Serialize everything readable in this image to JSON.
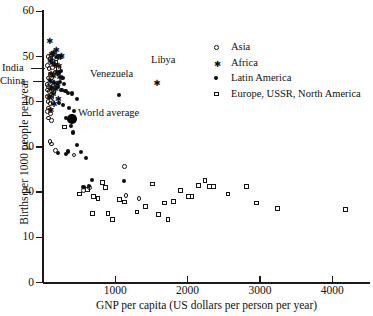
{
  "chart_data": {
    "type": "scatter",
    "title": "",
    "xlabel": "GNP per capita (US dollars per person per year)",
    "ylabel": "Births per 1000 people per year",
    "xlim": [
      0,
      4520
    ],
    "ylim": [
      0,
      62
    ],
    "xticks": [
      1000,
      2000,
      3000,
      4000
    ],
    "yticks": [
      0,
      10,
      20,
      30,
      40,
      50,
      60
    ],
    "grid": false,
    "legend_position": "top-right",
    "legend": [
      {
        "label": "Asia",
        "marker": "open-circle"
      },
      {
        "label": "Africa",
        "marker": "asterisk"
      },
      {
        "label": "Latin America",
        "marker": "filled-circle"
      },
      {
        "label": "Europe, USSR, North America",
        "marker": "open-square"
      }
    ],
    "annotations": [
      {
        "text": "India",
        "x": 160,
        "y": 44.0
      },
      {
        "text": "China",
        "x": 140,
        "y": 42.0
      },
      {
        "text": "Venezuela",
        "x": 1050,
        "y": 41.8
      },
      {
        "text": "Libya",
        "x": 1570,
        "y": 45.8
      },
      {
        "text": "World average",
        "x": 400,
        "y": 36.2
      }
    ],
    "series": [
      {
        "name": "Asia",
        "marker": "open-circle",
        "points": [
          [
            70,
            50.0
          ],
          [
            95,
            49.6
          ],
          [
            110,
            50.2
          ],
          [
            150,
            49.8
          ],
          [
            175,
            50.2
          ],
          [
            195,
            49.9
          ],
          [
            215,
            50.1
          ],
          [
            60,
            48.0
          ],
          [
            85,
            47.4
          ],
          [
            130,
            47.6
          ],
          [
            105,
            46.0
          ],
          [
            165,
            46.6
          ],
          [
            70,
            45.2
          ],
          [
            95,
            44.8
          ],
          [
            120,
            44.6
          ],
          [
            55,
            43.8
          ],
          [
            80,
            43.4
          ],
          [
            105,
            43.2
          ],
          [
            140,
            43.6
          ],
          [
            60,
            42.6
          ],
          [
            90,
            42.2
          ],
          [
            115,
            42.4
          ],
          [
            150,
            42.0
          ],
          [
            65,
            41.2
          ],
          [
            100,
            41.0
          ],
          [
            125,
            40.8
          ],
          [
            70,
            40.0
          ],
          [
            95,
            39.6
          ],
          [
            140,
            39.8
          ],
          [
            80,
            38.6
          ],
          [
            60,
            37.8
          ],
          [
            105,
            37.4
          ],
          [
            75,
            36.4
          ],
          [
            115,
            35.8
          ],
          [
            95,
            31.2
          ],
          [
            120,
            30.6
          ],
          [
            175,
            29.2
          ],
          [
            430,
            28.2
          ],
          [
            560,
            20.4
          ],
          [
            640,
            21.0
          ],
          [
            1130,
            25.6
          ],
          [
            1330,
            18.6
          ],
          [
            1150,
            19.2
          ]
        ]
      },
      {
        "name": "Africa",
        "marker": "asterisk",
        "points": [
          [
            85,
            53.4
          ],
          [
            175,
            51.4
          ],
          [
            115,
            50.6
          ],
          [
            140,
            50.8
          ],
          [
            200,
            50.0
          ],
          [
            230,
            49.8
          ],
          [
            250,
            50.2
          ],
          [
            95,
            49.0
          ],
          [
            125,
            48.6
          ],
          [
            160,
            48.2
          ],
          [
            210,
            47.8
          ],
          [
            185,
            46.4
          ],
          [
            105,
            46.2
          ],
          [
            135,
            45.6
          ],
          [
            225,
            45.4
          ],
          [
            90,
            44.6
          ],
          [
            150,
            44.2
          ],
          [
            195,
            44.0
          ],
          [
            110,
            43.0
          ],
          [
            165,
            42.8
          ],
          [
            130,
            41.8
          ],
          [
            80,
            41.0
          ],
          [
            205,
            40.6
          ],
          [
            145,
            39.4
          ],
          [
            100,
            38.2
          ],
          [
            1570,
            44.2
          ]
        ]
      },
      {
        "name": "Latin America",
        "marker": "filled-circle",
        "points": [
          [
            215,
            46.4
          ],
          [
            250,
            46.8
          ],
          [
            270,
            45.2
          ],
          [
            235,
            44.4
          ],
          [
            290,
            44.0
          ],
          [
            200,
            43.2
          ],
          [
            255,
            42.6
          ],
          [
            310,
            42.4
          ],
          [
            345,
            42.0
          ],
          [
            400,
            41.8
          ],
          [
            1050,
            41.4
          ],
          [
            470,
            40.6
          ],
          [
            225,
            39.8
          ],
          [
            280,
            39.2
          ],
          [
            360,
            38.6
          ],
          [
            430,
            38.0
          ],
          [
            320,
            36.4
          ],
          [
            390,
            34.6
          ],
          [
            420,
            33.2
          ],
          [
            465,
            30.4
          ],
          [
            350,
            29.0
          ],
          [
            530,
            28.8
          ],
          [
            210,
            28.6
          ],
          [
            320,
            28.4
          ],
          [
            600,
            27.6
          ],
          [
            680,
            22.6
          ],
          [
            560,
            21.2
          ],
          [
            1120,
            22.4
          ],
          [
            640,
            21.4
          ]
        ]
      },
      {
        "name": "Europe, USSR, North America",
        "marker": "open-square",
        "points": [
          [
            180,
            48.8
          ],
          [
            215,
            47.4
          ],
          [
            300,
            34.4
          ],
          [
            510,
            19.6
          ],
          [
            620,
            20.6
          ],
          [
            700,
            19.0
          ],
          [
            760,
            18.6
          ],
          [
            820,
            22.2
          ],
          [
            860,
            21.0
          ],
          [
            690,
            15.2
          ],
          [
            900,
            15.2
          ],
          [
            960,
            14.0
          ],
          [
            1060,
            18.4
          ],
          [
            1130,
            17.8
          ],
          [
            1300,
            15.6
          ],
          [
            1420,
            16.8
          ],
          [
            1520,
            21.8
          ],
          [
            1600,
            15.0
          ],
          [
            1680,
            17.6
          ],
          [
            1730,
            14.0
          ],
          [
            1800,
            18.0
          ],
          [
            1900,
            20.4
          ],
          [
            2010,
            19.0
          ],
          [
            2060,
            19.0
          ],
          [
            2150,
            21.4
          ],
          [
            2240,
            22.6
          ],
          [
            2300,
            21.2
          ],
          [
            2360,
            21.2
          ],
          [
            2560,
            19.6
          ],
          [
            2820,
            21.2
          ],
          [
            2950,
            17.6
          ],
          [
            3240,
            16.4
          ],
          [
            4180,
            16.2
          ]
        ]
      }
    ],
    "highlight": {
      "name": "World average",
      "marker": "large-filled-circle",
      "point": [
        400,
        36.2
      ]
    }
  }
}
